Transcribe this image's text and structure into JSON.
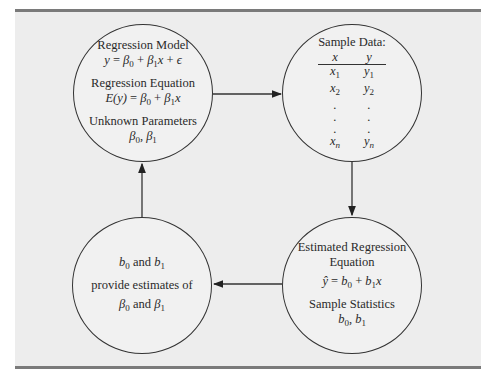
{
  "diagram": {
    "type": "cycle-flow",
    "nodes": [
      {
        "id": "population",
        "position": "top-left",
        "lines": [
          {
            "kind": "label",
            "text": "Regression Model"
          },
          {
            "kind": "math",
            "text": "y = β0 + β1x + ε"
          },
          {
            "kind": "label",
            "text": "Regression Equation"
          },
          {
            "kind": "math",
            "text": "E(y) = β0 + β1x"
          },
          {
            "kind": "label",
            "text": "Unknown Parameters"
          },
          {
            "kind": "math",
            "text": "β0, β1"
          }
        ]
      },
      {
        "id": "sample",
        "position": "top-right",
        "title": "Sample Data:",
        "table": {
          "headers": [
            "x",
            "y"
          ],
          "rows": [
            [
              "x1",
              "y1"
            ],
            [
              "x2",
              "y2"
            ],
            [
              ".",
              "."
            ],
            [
              ".",
              "."
            ],
            [
              ".",
              "."
            ],
            [
              "xn",
              "yn"
            ]
          ]
        }
      },
      {
        "id": "estimates",
        "position": "bottom-right",
        "lines": [
          {
            "kind": "label",
            "text": "Estimated Regression Equation"
          },
          {
            "kind": "math",
            "text": "ŷ = b0 + b1x"
          },
          {
            "kind": "label",
            "text": "Sample Statistics"
          },
          {
            "kind": "math",
            "text": "b0, b1"
          }
        ]
      },
      {
        "id": "inference",
        "position": "bottom-left",
        "lines": [
          {
            "kind": "math",
            "text": "b0 and b1"
          },
          {
            "kind": "label",
            "text": "provide estimates of"
          },
          {
            "kind": "math",
            "text": "β0 and β1"
          }
        ]
      }
    ],
    "edges": [
      {
        "from": "population",
        "to": "sample",
        "direction": "right"
      },
      {
        "from": "sample",
        "to": "estimates",
        "direction": "down"
      },
      {
        "from": "estimates",
        "to": "inference",
        "direction": "left"
      },
      {
        "from": "inference",
        "to": "population",
        "direction": "up"
      }
    ],
    "text": {
      "regression_model": "Regression Model",
      "y": "y",
      "eq": " = ",
      "plus": " + ",
      "beta": "β",
      "x": "x",
      "epsilon": "ϵ",
      "regression_equation": "Regression Equation",
      "Ey": "E(y)",
      "unknown_parameters": "Unknown Parameters",
      "comma": ", ",
      "sub0": "0",
      "sub1": "1",
      "sub2": "2",
      "subn": "n",
      "sample_data": "Sample Data:",
      "dot": ".",
      "estimated_regression": "Estimated Regression",
      "equation": "Equation",
      "yhat": "ŷ",
      "b": "b",
      "sample_statistics": "Sample Statistics",
      "and": " and ",
      "provide_estimates_of": "provide estimates of"
    },
    "colors": {
      "frame_bg": "#ededed",
      "frame_rule": "#7a7a7a",
      "stroke": "#333333"
    }
  }
}
